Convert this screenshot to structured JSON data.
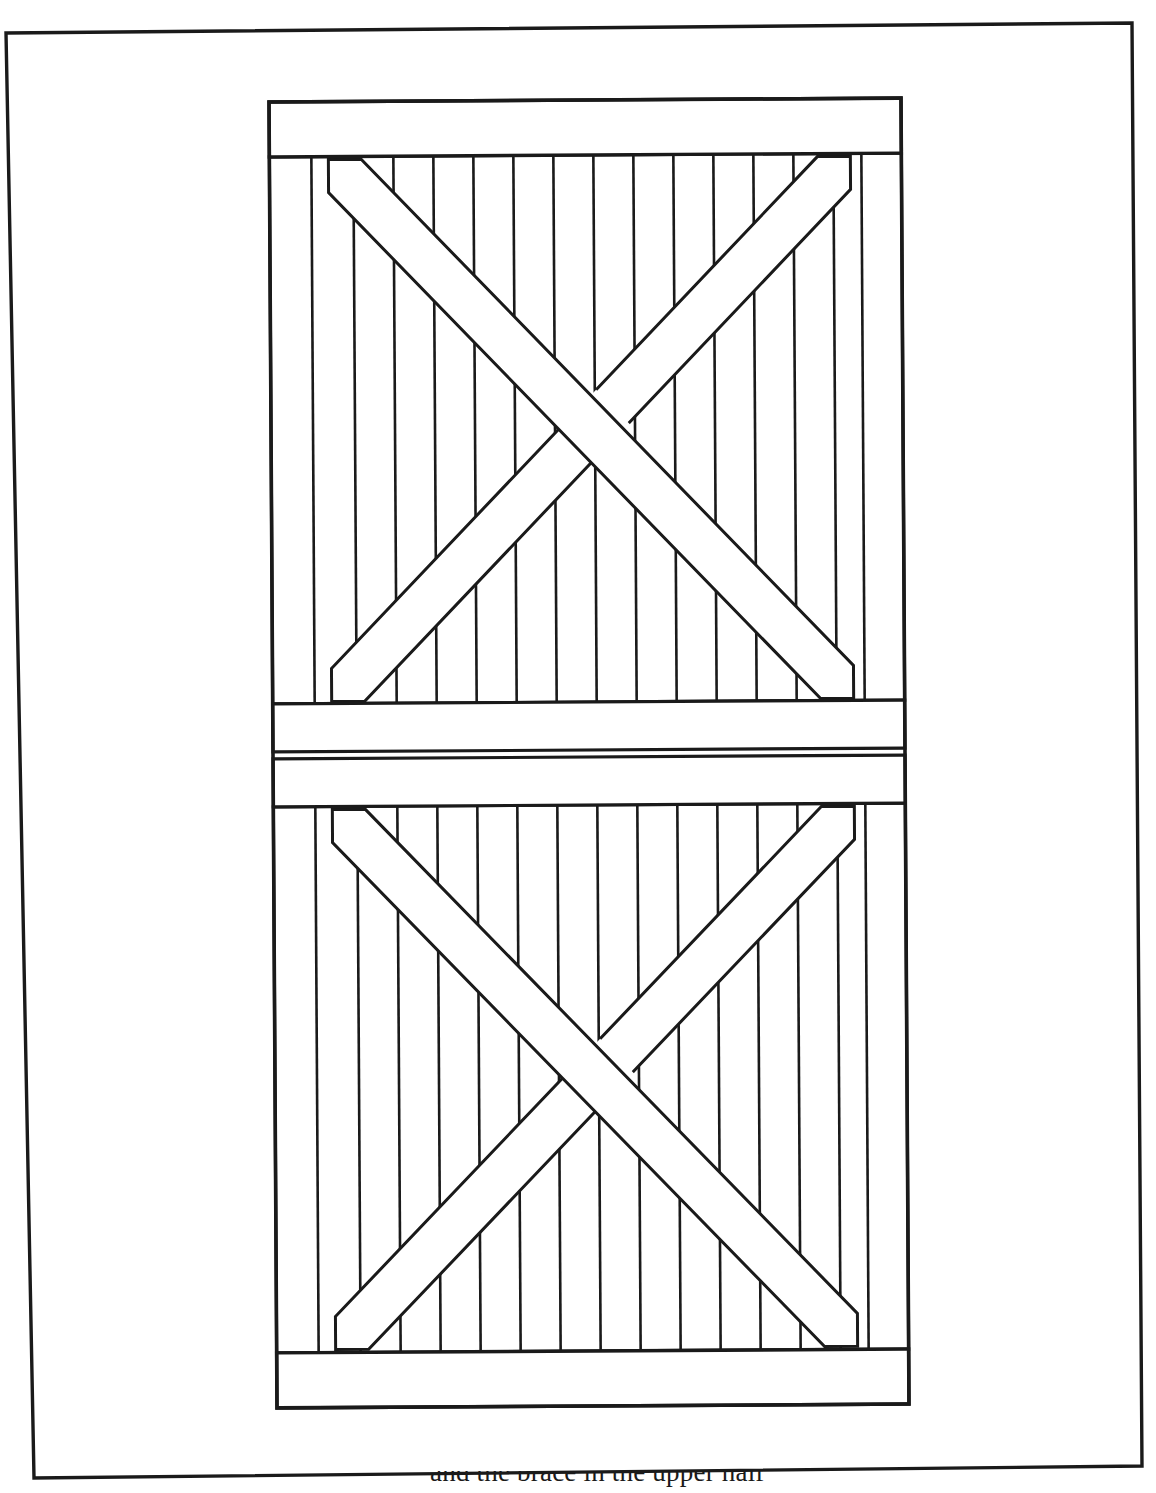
{
  "document": {
    "title": "Cross-Braced Barn Door",
    "type": "line-drawing",
    "medium": "scanned book page",
    "background_color": "#ffffff",
    "ink_color": "#1a1a1a"
  },
  "page_frame": {
    "label": "page border rectangle",
    "stroke_color": "#1a1a1a",
    "stroke_width": 3,
    "rotation_note": "slightly skewed as on a scanned page",
    "corners": {
      "top_left": [
        6,
        33
      ],
      "top_right": [
        1132,
        23
      ],
      "bottom_right": [
        1142,
        1466
      ],
      "bottom_left": [
        34,
        1478
      ]
    }
  },
  "door": {
    "label": "batten door elevation",
    "outline": {
      "left": 271,
      "right": 903,
      "top": 100,
      "bottom": 1406
    },
    "stroke_color": "#1a1a1a",
    "stroke_width": 3.2,
    "panel_count": 2,
    "panel_labels": [
      "upper panel",
      "lower panel"
    ]
  },
  "rails": [
    {
      "name": "top-rail",
      "y_top": 100,
      "y_bottom": 155
    },
    {
      "name": "middle-rail-upper",
      "y_top": 702,
      "y_bottom": 750
    },
    {
      "name": "middle-rail-lower",
      "y_top": 757,
      "y_bottom": 805
    },
    {
      "name": "bottom-rail",
      "y_top": 1351,
      "y_bottom": 1406
    }
  ],
  "boards": {
    "label": "vertical tongue-and-groove boards",
    "count": 16,
    "left_edge": 271,
    "right_edge": 903,
    "joint_x": [
      313,
      355,
      395,
      435,
      475,
      515,
      555,
      595,
      635,
      675,
      715,
      755,
      795,
      835,
      863
    ],
    "segments": [
      {
        "name": "upper-panel-boards",
        "y_top": 155,
        "y_bottom": 702
      },
      {
        "name": "lower-panel-boards",
        "y_top": 805,
        "y_bottom": 1351
      }
    ]
  },
  "braces": {
    "label": "diagonal X braces",
    "width": 46,
    "upper_panel": [
      {
        "name": "upper-brace-nw-se",
        "direction": "northwest-to-southeast",
        "start": [
          330,
          158
        ],
        "end": [
          852,
          700
        ],
        "over": true
      },
      {
        "name": "upper-brace-sw-ne",
        "direction": "southwest-to-northeast",
        "start": [
          330,
          700
        ],
        "end": [
          852,
          158
        ],
        "over": false
      }
    ],
    "lower_panel": [
      {
        "name": "lower-brace-nw-se",
        "direction": "northwest-to-southeast",
        "start": [
          330,
          808
        ],
        "end": [
          852,
          1348
        ],
        "over": true
      },
      {
        "name": "lower-brace-sw-ne",
        "direction": "southwest-to-northeast",
        "start": [
          330,
          1348
        ],
        "end": [
          852,
          808
        ],
        "over": false
      }
    ]
  },
  "caption": {
    "text": "and the brace in the upper half",
    "clipped_note": "only the ascender tops of the caption line are visible at the page bottom"
  }
}
